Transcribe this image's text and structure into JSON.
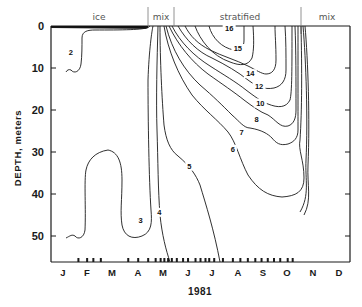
{
  "chart_data": {
    "type": "contour",
    "title": "",
    "xlabel": "1981",
    "ylabel": "DEPTH, meters",
    "x_categories": [
      "J",
      "F",
      "M",
      "A",
      "M",
      "J",
      "J",
      "A",
      "S",
      "O",
      "N",
      "D"
    ],
    "y_ticks": [
      0,
      10,
      20,
      30,
      40,
      50
    ],
    "ylim": [
      0,
      56
    ],
    "y_inverted": true,
    "grid": false,
    "seasons": [
      {
        "label": "ice",
        "start_month": 0.0,
        "end_month": 4.05
      },
      {
        "label": "mix",
        "start_month": 4.05,
        "end_month": 4.75
      },
      {
        "label": "stratified",
        "start_month": 4.75,
        "end_month": 9.9
      },
      {
        "label": "mix",
        "start_month": 9.9,
        "end_month": 12.0
      }
    ],
    "contour_levels": [
      2,
      3,
      4,
      5,
      6,
      7,
      8,
      10,
      12,
      14,
      15,
      16
    ],
    "contour_units": "°C",
    "contour_labels": [
      {
        "level": "2",
        "month": 0.8,
        "depth": 6
      },
      {
        "level": "3",
        "month": 3.6,
        "depth": 46
      },
      {
        "level": "4",
        "month": 4.35,
        "depth": 44
      },
      {
        "level": "5",
        "month": 5.55,
        "depth": 33
      },
      {
        "level": "6",
        "month": 7.3,
        "depth": 29
      },
      {
        "level": "7",
        "month": 7.65,
        "depth": 25
      },
      {
        "level": "8",
        "month": 8.25,
        "depth": 22
      },
      {
        "level": "10",
        "month": 8.4,
        "depth": 18
      },
      {
        "level": "12",
        "month": 8.35,
        "depth": 14
      },
      {
        "level": "14",
        "month": 8.0,
        "depth": 11
      },
      {
        "level": "15",
        "month": 7.5,
        "depth": 5
      },
      {
        "level": "16",
        "month": 7.15,
        "depth": 0.3
      }
    ],
    "sampling_marks_months": [
      1.1,
      1.45,
      1.7,
      2.0,
      3.1,
      3.5,
      3.9,
      4.2,
      4.4,
      4.55,
      4.7,
      4.85,
      5.05,
      5.3,
      5.5,
      5.8,
      6.0,
      6.2,
      6.35,
      6.55,
      6.9,
      7.3,
      7.6,
      7.9,
      8.2,
      8.45,
      8.7,
      8.95,
      9.2,
      9.5,
      9.7
    ]
  },
  "axes": {
    "y_title": "DEPTH, meters",
    "x_title": "1981",
    "y_tick_labels": [
      "0",
      "10",
      "20",
      "30",
      "40",
      "50"
    ],
    "month_labels": [
      "J",
      "F",
      "M",
      "A",
      "M",
      "J",
      "J",
      "A",
      "S",
      "O",
      "N",
      "D"
    ]
  },
  "seasons": {
    "ice": "ice",
    "mix1": "mix",
    "stratified": "stratified",
    "mix2": "mix"
  }
}
